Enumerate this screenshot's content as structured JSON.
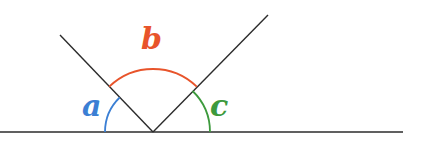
{
  "diagram": {
    "type": "angles-on-a-straight-line",
    "vertex": {
      "x": 153,
      "y": 132
    },
    "baseline": {
      "x1": 0,
      "x2": 403,
      "y": 132,
      "color": "#2b2b2b"
    },
    "rays": [
      {
        "name": "left-ray",
        "angle_deg": 134,
        "end": {
          "x": 60,
          "y": 35
        }
      },
      {
        "name": "right-ray",
        "angle_deg": 46,
        "end": {
          "x": 268,
          "y": 15
        }
      }
    ],
    "angles": [
      {
        "label": "a",
        "color": "#3b7fd4",
        "radius": 48,
        "from_deg": 134,
        "to_deg": 180
      },
      {
        "label": "b",
        "color": "#e8542b",
        "radius": 63,
        "from_deg": 46,
        "to_deg": 134
      },
      {
        "label": "c",
        "color": "#3d9a3d",
        "radius": 57,
        "from_deg": 0,
        "to_deg": 46
      }
    ]
  },
  "labels": {
    "a": "a",
    "b": "b",
    "c": "c"
  }
}
